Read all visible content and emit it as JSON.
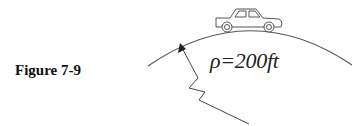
{
  "figure": {
    "label": "Figure 7-9",
    "radius_label": "ρ=200ft",
    "radius_symbol": "ρ",
    "radius_value": 200,
    "radius_unit": "ft",
    "elements": [
      "car-icon",
      "curved-hill-arc",
      "radius-arrow-zigzag"
    ],
    "colors": {
      "stroke": "#444444",
      "text": "#111111"
    }
  }
}
